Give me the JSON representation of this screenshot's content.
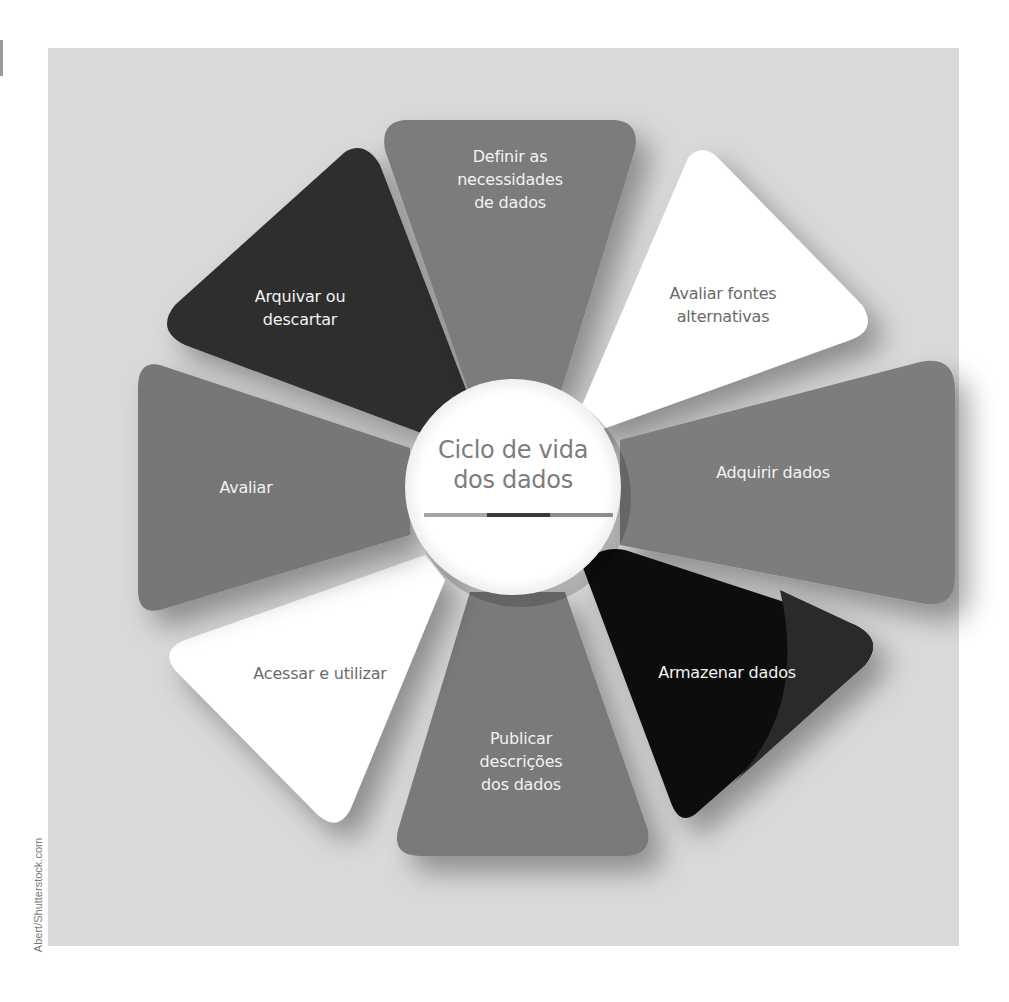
{
  "diagram": {
    "title": "Ciclo de vida\ndos dados",
    "type": "cycle",
    "underline_colors": [
      "#a6a6a6",
      "#3a3a3a",
      "#8c8c8c"
    ],
    "background_color": "#d9d9d9",
    "stages": [
      {
        "position": "top",
        "label": "Definir as\nnecessidades\nde dados",
        "color": "#7b7b7b"
      },
      {
        "position": "top-right",
        "label": "Avaliar fontes\nalternativas",
        "color": "#ffffff"
      },
      {
        "position": "right",
        "label": "Adquirir dados",
        "color": "#7d7d7d"
      },
      {
        "position": "bottom-right",
        "label": "Armazenar dados",
        "color": "#0d0d0d"
      },
      {
        "position": "bottom",
        "label": "Publicar\ndescrições\ndos dados",
        "color": "#7a7a7a"
      },
      {
        "position": "bottom-left",
        "label": "Acessar e utilizar",
        "color": "#ffffff"
      },
      {
        "position": "left",
        "label": "Avaliar",
        "color": "#777777"
      },
      {
        "position": "top-left",
        "label": "Arquivar ou\ndescartar",
        "color": "#2e2e2e"
      }
    ]
  },
  "credit": "Abert/Shutterstock.com"
}
